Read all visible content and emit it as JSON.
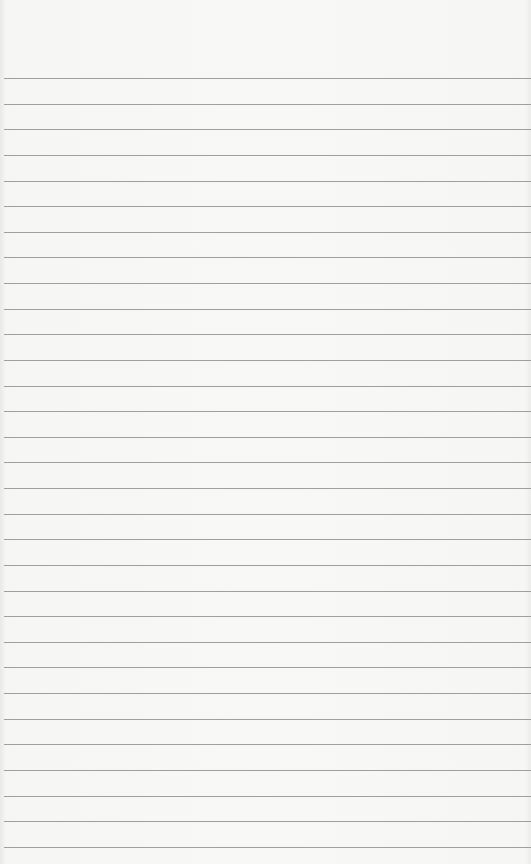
{
  "paper": {
    "description": "Blank lined notebook paper",
    "background_color": "#f6f6f4",
    "line_color": "#8f8f8c",
    "first_line_y": 78,
    "line_spacing": 25.63,
    "line_count": 31
  }
}
